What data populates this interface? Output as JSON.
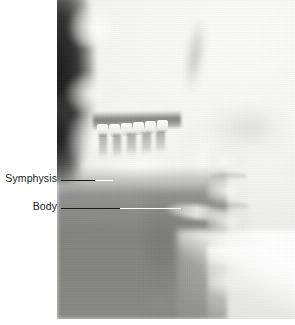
{
  "figure": {
    "type": "lateral-cephalometric-radiograph",
    "background_color": "#ffffff"
  },
  "radiograph": {
    "alt_text": "Lateral cephalometric radiograph showing facial profile, maxillary and mandibular teeth, mandible and cervical vertebrae",
    "left": 57,
    "top": 0,
    "width": 238,
    "height": 319
  },
  "annotations": [
    {
      "id": "symphysis",
      "label": "Symphysis",
      "label_right_x": 57,
      "label_y": 172,
      "line_y": 180,
      "line_start_x": 61,
      "line_end_x": 112,
      "color": "#1a1a1a"
    },
    {
      "id": "body",
      "label": "Body",
      "label_right_x": 57,
      "label_y": 200,
      "line_y": 208,
      "line_start_x": 61,
      "line_end_x": 181,
      "color": "#1a1a1a"
    }
  ],
  "colors": {
    "label_text": "#1a1a1a",
    "leader_dark": "#1a1a1a",
    "leader_light": "#ffffff",
    "page_background": "#ffffff"
  }
}
